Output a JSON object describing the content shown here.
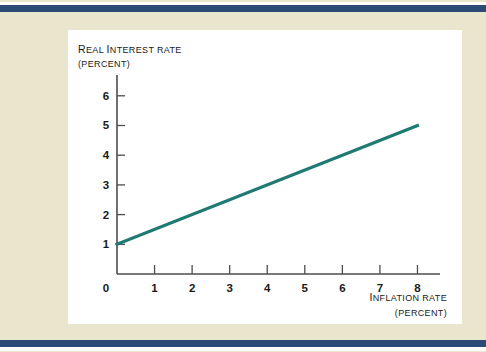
{
  "figure": {
    "background_color": "#e9e6cd",
    "panel_color": "#ffffff",
    "rule_color": "#2c4a76"
  },
  "chart_data": {
    "type": "line",
    "title": "",
    "xlabel": "INFLATION RATE",
    "xlabel_unit": "(PERCENT)",
    "ylabel": "REAL INTEREST RATE",
    "ylabel_unit": "(PERCENT)",
    "xlabel_lead": "I",
    "xlabel_rest": "NFLATION RATE",
    "ylabel_lead": "R",
    "ylabel_rest": "EAL ",
    "ylabel_lead2": "I",
    "ylabel_rest2": "NTEREST RATE",
    "xlim": [
      0,
      8.6
    ],
    "ylim": [
      0,
      6.7
    ],
    "xticks": [
      0,
      1,
      2,
      3,
      4,
      5,
      6,
      7,
      8
    ],
    "yticks": [
      0,
      1,
      2,
      3,
      4,
      5,
      6
    ],
    "xtick_labels": [
      "0",
      "1",
      "2",
      "3",
      "4",
      "5",
      "6",
      "7",
      "8"
    ],
    "ytick_labels": [
      "0",
      "1",
      "2",
      "3",
      "4",
      "5",
      "6"
    ],
    "grid": false,
    "legend": false,
    "line_color": "#1f7a72",
    "series": [
      {
        "name": "real interest rate",
        "x": [
          0,
          8
        ],
        "values": [
          1,
          5
        ]
      }
    ]
  }
}
